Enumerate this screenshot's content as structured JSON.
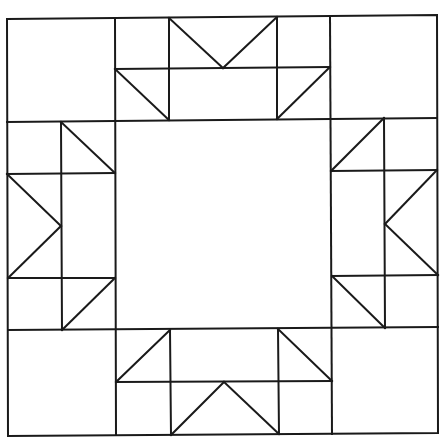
{
  "diagram": {
    "title": "Quilt block pattern",
    "stroke_color": "#1a1a1a",
    "background_color": "#ffffff",
    "stroke_width": 2,
    "outer_border": [
      [
        7,
        19
      ],
      [
        437,
        15
      ],
      [
        438,
        433
      ],
      [
        8,
        436
      ]
    ],
    "grid": {
      "vertical_lines": [
        {
          "name": "col-line-1",
          "from": [
            115,
            19
          ],
          "to": [
            116,
            435
          ]
        },
        {
          "name": "col-line-2",
          "from": [
            330,
            16
          ],
          "to": [
            332,
            434
          ]
        }
      ],
      "horizontal_lines": [
        {
          "name": "row-line-1",
          "from": [
            7,
            122
          ],
          "to": [
            437,
            118
          ]
        },
        {
          "name": "row-line-2",
          "from": [
            8,
            330
          ],
          "to": [
            438,
            327
          ]
        }
      ]
    },
    "bands": {
      "top": {
        "lines": [
          {
            "from": [
              169,
              18
            ],
            "to": [
              169,
              120
            ]
          },
          {
            "from": [
              277,
              17
            ],
            "to": [
              277,
              119
            ]
          },
          {
            "from": [
              115,
              69
            ],
            "to": [
              330,
              67
            ]
          }
        ],
        "diagonals": [
          {
            "from": [
              169,
              18
            ],
            "to": [
              223,
              68
            ]
          },
          {
            "from": [
              223,
              68
            ],
            "to": [
              277,
              17
            ]
          },
          {
            "from": [
              115,
              69
            ],
            "to": [
              169,
              120
            ]
          },
          {
            "from": [
              277,
              119
            ],
            "to": [
              330,
              67
            ]
          }
        ]
      },
      "left": {
        "lines": [
          {
            "from": [
              61,
              122
            ],
            "to": [
              62,
              330
            ]
          },
          {
            "from": [
              7,
              174
            ],
            "to": [
              115,
              173
            ]
          },
          {
            "from": [
              8,
              278
            ],
            "to": [
              115,
              278
            ]
          }
        ],
        "diagonals": [
          {
            "from": [
              7,
              174
            ],
            "to": [
              61,
              226
            ]
          },
          {
            "from": [
              61,
              226
            ],
            "to": [
              8,
              278
            ]
          },
          {
            "from": [
              61,
              122
            ],
            "to": [
              115,
              173
            ]
          },
          {
            "from": [
              62,
              330
            ],
            "to": [
              115,
              278
            ]
          }
        ]
      },
      "right": {
        "lines": [
          {
            "from": [
              384,
              118
            ],
            "to": [
              385,
              328
            ]
          },
          {
            "from": [
              331,
              171
            ],
            "to": [
              437,
              170
            ]
          },
          {
            "from": [
              332,
              276
            ],
            "to": [
              438,
              275
            ]
          }
        ],
        "diagonals": [
          {
            "from": [
              331,
              171
            ],
            "to": [
              384,
              118
            ]
          },
          {
            "from": [
              385,
              224
            ],
            "to": [
              437,
              170
            ]
          },
          {
            "from": [
              385,
              224
            ],
            "to": [
              438,
              275
            ]
          },
          {
            "from": [
              332,
              276
            ],
            "to": [
              385,
              328
            ]
          }
        ]
      },
      "bottom": {
        "lines": [
          {
            "from": [
              170,
              330
            ],
            "to": [
              171,
              435
            ]
          },
          {
            "from": [
              278,
              329
            ],
            "to": [
              279,
              434
            ]
          },
          {
            "from": [
              116,
              382
            ],
            "to": [
              332,
              381
            ]
          }
        ],
        "diagonals": [
          {
            "from": [
              116,
              382
            ],
            "to": [
              170,
              330
            ]
          },
          {
            "from": [
              278,
              329
            ],
            "to": [
              332,
              381
            ]
          },
          {
            "from": [
              171,
              435
            ],
            "to": [
              224,
              382
            ]
          },
          {
            "from": [
              224,
              382
            ],
            "to": [
              279,
              434
            ]
          }
        ]
      }
    }
  }
}
